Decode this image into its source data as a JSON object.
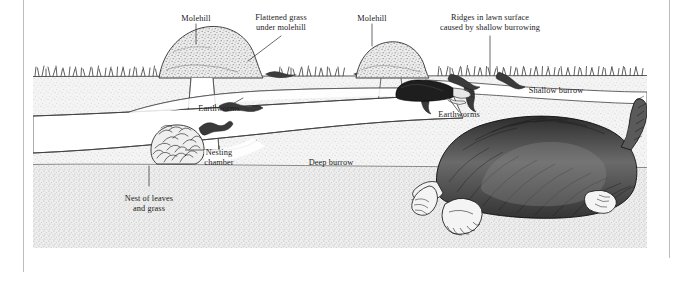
{
  "figure": {
    "kind": "cross-section-illustration",
    "medium": "pen-and-ink stipple engraving",
    "panel": {
      "background": "#ffffff",
      "soil_tone": "#f2f2f2",
      "ink": "#1a1a1a",
      "left": 33,
      "top": 0,
      "width": 614,
      "height": 268
    },
    "page": {
      "width": 675,
      "height": 282,
      "background": "#ffffff",
      "rule_color": "#b9bcc2"
    }
  },
  "labels": [
    {
      "id": "molehill-left",
      "text": "Molehill",
      "x": 196,
      "y": 14,
      "align": "center"
    },
    {
      "id": "flattened-grass",
      "text": "Flattened grass",
      "x": 281,
      "y": 13,
      "align": "center"
    },
    {
      "id": "flattened-grass-2",
      "text": "under molehill",
      "x": 281,
      "y": 23,
      "align": "center"
    },
    {
      "id": "molehill-right",
      "text": "Molehill",
      "x": 372,
      "y": 14,
      "align": "center"
    },
    {
      "id": "ridges-1",
      "text": "Ridges in lawn surface",
      "x": 490,
      "y": 13,
      "align": "center"
    },
    {
      "id": "ridges-2",
      "text": "caused by shallow burrowing",
      "x": 490,
      "y": 23,
      "align": "center"
    },
    {
      "id": "earthworms-left",
      "text": "Earthworms",
      "x": 219,
      "y": 104,
      "align": "center"
    },
    {
      "id": "earthworms-right",
      "text": "Earthworms",
      "x": 459,
      "y": 110,
      "align": "center"
    },
    {
      "id": "shallow-burrow",
      "text": "Shallow burrow",
      "x": 556,
      "y": 86,
      "align": "center"
    },
    {
      "id": "nesting-chamber-1",
      "text": "Nesting",
      "x": 219,
      "y": 148,
      "align": "center"
    },
    {
      "id": "nesting-chamber-2",
      "text": "chamber",
      "x": 219,
      "y": 158,
      "align": "center"
    },
    {
      "id": "deep-burrow",
      "text": "Deep burrow",
      "x": 331,
      "y": 158,
      "align": "center"
    },
    {
      "id": "nest-of-leaves-1",
      "text": "Nest of leaves",
      "x": 149,
      "y": 194,
      "align": "center"
    },
    {
      "id": "nest-of-leaves-2",
      "text": "and grass",
      "x": 149,
      "y": 204,
      "align": "center"
    }
  ],
  "scene_elements": [
    {
      "id": "lawn-grass-line",
      "name": "tufted grass along soil surface"
    },
    {
      "id": "molehill-mound-1",
      "name": "large conical molehill at left"
    },
    {
      "id": "molehill-mound-2",
      "name": "smaller molehill at centre-right"
    },
    {
      "id": "shallow-tunnel",
      "name": "shallow burrow just below the turf"
    },
    {
      "id": "deep-tunnel",
      "name": "deep burrow running across the section"
    },
    {
      "id": "vertical-shaft",
      "name": "vertical shaft connecting deep burrow to molehill"
    },
    {
      "id": "nest-ball",
      "name": "ball of leaves and grass in nesting chamber"
    },
    {
      "id": "mole-small",
      "name": "mole tunnelling in the shallow burrow"
    },
    {
      "id": "mole-large",
      "name": "large mole shown in the deep burrow at right"
    },
    {
      "id": "earthworm-1",
      "name": "earthworm in deep burrow, left"
    },
    {
      "id": "earthworm-2",
      "name": "earthworm entering deep burrow, left"
    },
    {
      "id": "earthworm-3",
      "name": "earthworm near shallow burrow, right"
    },
    {
      "id": "earthworm-4",
      "name": "earthworm beside mole, right"
    }
  ]
}
